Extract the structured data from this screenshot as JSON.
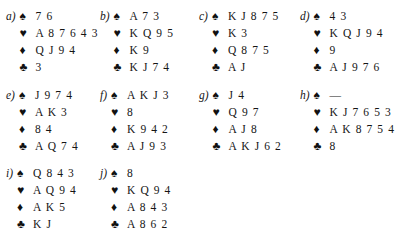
{
  "document": {
    "title": "Bridge hands exercise",
    "suit_order": [
      "spade",
      "heart",
      "diamond",
      "club"
    ],
    "suit_glyphs": {
      "spade": "♠",
      "heart": "♥",
      "diamond": "♦",
      "club": "♣"
    },
    "void_mark": "—",
    "ink_color": "#151515"
  },
  "hands": [
    {
      "label": "a)",
      "spades": "7 6",
      "hearts": "A 8 7 6 4 3",
      "diamonds": "Q J 9 4",
      "clubs": "3"
    },
    {
      "label": "b)",
      "spades": "A 7 3",
      "hearts": "K Q 9 5",
      "diamonds": "K 9",
      "clubs": "K J 7 4"
    },
    {
      "label": "c)",
      "spades": "K J 8 7 5",
      "hearts": "K 3",
      "diamonds": "Q 8 7 5",
      "clubs": "A J"
    },
    {
      "label": "d)",
      "spades": "4 3",
      "hearts": "K Q J 9 4",
      "diamonds": "9",
      "clubs": "A J 9 7 6"
    },
    {
      "label": "e)",
      "spades": "J 9 7 4",
      "hearts": "A K 3",
      "diamonds": "8 4",
      "clubs": "A Q 7 4"
    },
    {
      "label": "f)",
      "spades": "A K J 3",
      "hearts": "8",
      "diamonds": "K 9 4 2",
      "clubs": "A J 9 3"
    },
    {
      "label": "g)",
      "spades": "J 4",
      "hearts": "Q 9 7",
      "diamonds": "A J 8",
      "clubs": "A K J 6 2"
    },
    {
      "label": "h)",
      "spades": "—",
      "hearts": "K J 7 6 5 3",
      "diamonds": "A K 8 7 5 4",
      "clubs": "8"
    },
    {
      "label": "i)",
      "spades": "Q 8 4 3",
      "hearts": "A Q 9 4",
      "diamonds": "A K 5",
      "clubs": "K J"
    },
    {
      "label": "j)",
      "spades": "8",
      "hearts": "K Q 9 4",
      "diamonds": "A 8 4 3",
      "clubs": "A 8 6 2"
    }
  ]
}
